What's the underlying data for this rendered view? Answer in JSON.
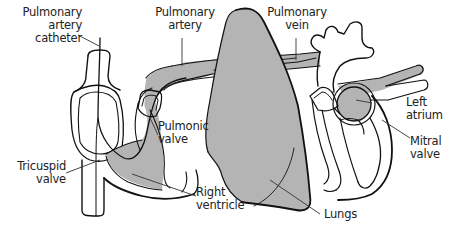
{
  "diagram": {
    "colors": {
      "fill": "#b4b4b4",
      "stroke": "#111111",
      "background": "#ffffff",
      "text": "#222222"
    },
    "labels": {
      "pa_catheter": "Pulmonary\nartery\ncatheter",
      "pulmonary_artery": "Pulmonary\nartery",
      "pulmonary_vein": "Pulmonary\nvein",
      "left_atrium": "Left\natrium",
      "mitral_valve": "Mitral\nvalve",
      "pulmonic_valve": "Pulmonic\nvalve",
      "tricuspid_valve": "Tricuspid\nvalve",
      "right_ventricle": "Right\nventricle",
      "lungs": "Lungs"
    }
  }
}
